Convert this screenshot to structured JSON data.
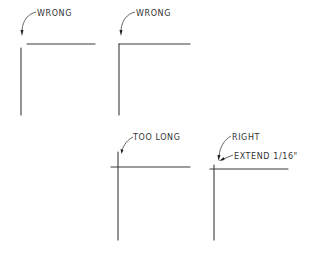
{
  "diagram": {
    "type": "corner-line-extension-examples",
    "panels": [
      {
        "id": "wrong-1",
        "label": "WRONG",
        "description": "Lines do not meet; gap at corner"
      },
      {
        "id": "wrong-2",
        "label": "WRONG",
        "description": "Lines meet exactly with no extension"
      },
      {
        "id": "too-long",
        "label": "TOO LONG",
        "description": "Lines cross and overshoot too far"
      },
      {
        "id": "right",
        "label": "RIGHT",
        "sublabel": "EXTEND 1/16\"",
        "description": "Lines cross with slight extension"
      }
    ]
  },
  "colors": {
    "ink": "#3a3a3a",
    "background": "#ffffff"
  }
}
